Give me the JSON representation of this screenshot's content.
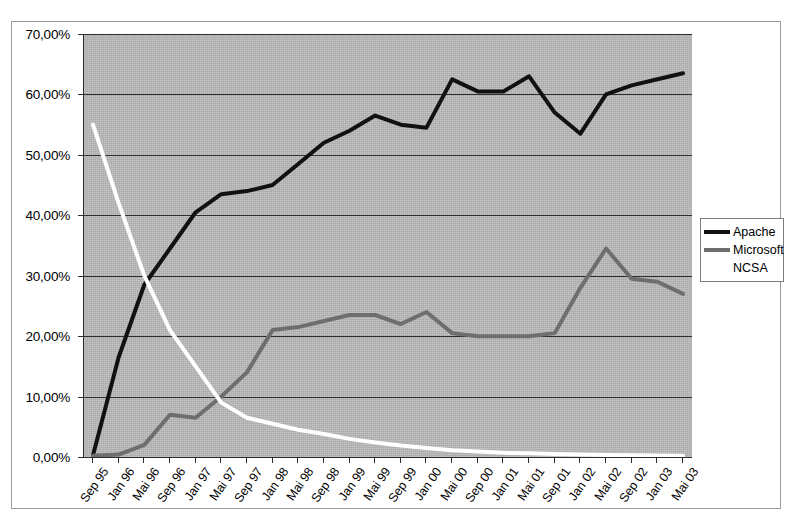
{
  "chart_data": {
    "type": "line",
    "title": "",
    "xlabel": "",
    "ylabel": "",
    "ylim": [
      0,
      70
    ],
    "y_tick_labels": [
      "0,00%",
      "10,00%",
      "20,00%",
      "30,00%",
      "40,00%",
      "50,00%",
      "60,00%",
      "70,00%"
    ],
    "y_ticks": [
      0,
      10,
      20,
      30,
      40,
      50,
      60,
      70
    ],
    "grid": true,
    "legend_position": "right",
    "plot_background": "#a8a8a8",
    "categories": [
      "Sep 95",
      "Jan 96",
      "Mai 96",
      "Sep 96",
      "Jan 97",
      "Mai 97",
      "Sep 97",
      "Jan 98",
      "Mai 98",
      "Sep 98",
      "Jan 99",
      "Mai 99",
      "Sep 99",
      "Jan 00",
      "Mai 00",
      "Sep 00",
      "Jan 01",
      "Mai 01",
      "Sep 01",
      "Jan 02",
      "Mai 02",
      "Sep 02",
      "Jan 03",
      "Mai 03"
    ],
    "series": [
      {
        "name": "Apache",
        "color": "#111111",
        "values": [
          0.3,
          16.5,
          28.5,
          34.5,
          40.5,
          43.5,
          44.0,
          45.0,
          48.5,
          52.0,
          54.0,
          56.5,
          55.0,
          54.5,
          62.5,
          60.5,
          60.5,
          63.0,
          57.0,
          53.5,
          60.0,
          61.5,
          62.5,
          63.5
        ]
      },
      {
        "name": "Microsoft",
        "color": "#6e6e6e",
        "values": [
          0.2,
          0.4,
          2.0,
          7.0,
          6.5,
          10.0,
          14.0,
          21.0,
          21.5,
          22.5,
          23.5,
          23.5,
          22.0,
          24.0,
          20.5,
          20.0,
          20.0,
          20.0,
          20.5,
          28.0,
          34.5,
          29.5,
          29.0,
          27.0
        ]
      },
      {
        "name": "NCSA",
        "color": "#ffffff",
        "values": [
          55.0,
          42.0,
          30.0,
          21.0,
          15.0,
          9.0,
          6.5,
          5.5,
          4.5,
          3.8,
          3.0,
          2.4,
          1.9,
          1.5,
          1.1,
          0.9,
          0.7,
          0.6,
          0.5,
          0.4,
          0.35,
          0.3,
          0.25,
          0.2
        ]
      }
    ]
  },
  "legend": {
    "items": [
      {
        "label": "Apache",
        "color": "#111111"
      },
      {
        "label": "Microsoft",
        "color": "#6e6e6e"
      },
      {
        "label": "NCSA",
        "color": "#ffffff"
      }
    ]
  }
}
